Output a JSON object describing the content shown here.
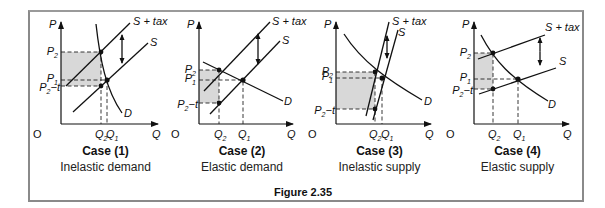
{
  "figure": {
    "caption": "Figure 2.35",
    "labels": {
      "price_axis": "P",
      "quantity_axis": "Q",
      "origin": "O",
      "supply": "S",
      "supply_tax": "S + tax",
      "demand": "D",
      "p2": "P",
      "p2_sub": "2",
      "p1": "P",
      "p1_sub": "1",
      "p2t": "P",
      "p2t_sub": "2",
      "p2t_suffix": "−t",
      "q2": "Q",
      "q2_sub": "2",
      "q1": "Q",
      "q1_sub": "1"
    },
    "cases": [
      {
        "title": "Case (1)",
        "subtitle": "Inelastic demand"
      },
      {
        "title": "Case (2)",
        "subtitle": "Elastic demand"
      },
      {
        "title": "Case (3)",
        "subtitle": "Inelastic supply"
      },
      {
        "title": "Case (4)",
        "subtitle": "Elastic supply"
      }
    ]
  }
}
